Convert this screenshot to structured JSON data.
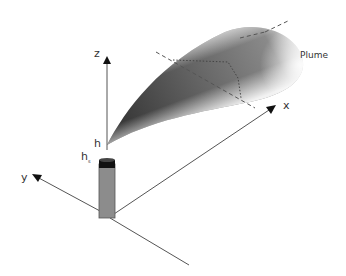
{
  "diagram": {
    "axes": {
      "z_label": "z",
      "x_label": "x",
      "y_label": "y"
    },
    "labels": {
      "effective_height": "h",
      "stack_height_main": "h",
      "stack_height_sub": "s",
      "plume": "Plume"
    },
    "colors": {
      "axis": "#555555",
      "stack_body": "#8c8c8c",
      "stack_cap": "#111111",
      "plume_dark": "#3a3a3a",
      "dashed": "#555555"
    }
  }
}
